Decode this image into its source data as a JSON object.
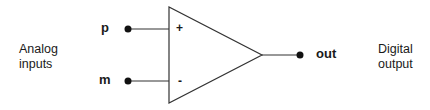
{
  "diagram": {
    "type": "comparator",
    "left_label": "Analog\ninputs",
    "left_label_lines": [
      "Analog",
      "inputs"
    ],
    "right_label_lines": [
      "Digital",
      "output"
    ],
    "inputs": [
      {
        "name": "p",
        "polarity": "+"
      },
      {
        "name": "m",
        "polarity": "-"
      }
    ],
    "output": {
      "name": "out"
    },
    "colors": {
      "stroke": "#333333",
      "text": "#1a1a1a",
      "background": "#ffffff"
    }
  }
}
